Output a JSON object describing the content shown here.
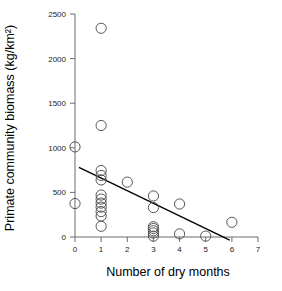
{
  "chart_data": {
    "type": "scatter",
    "title": "",
    "xlabel": "Number of dry months",
    "ylabel": "Primate community biomass (kg/km²)",
    "xlim": [
      0,
      7
    ],
    "ylim": [
      0,
      2500
    ],
    "xticks": [
      0,
      1,
      2,
      3,
      4,
      5,
      6,
      7
    ],
    "xtick_labels": [
      "0",
      "1",
      "2",
      "3",
      "4",
      "5",
      "6",
      "7"
    ],
    "yticks": [
      0,
      500,
      1000,
      1500,
      2000,
      2500
    ],
    "ytick_labels": [
      "0",
      "500",
      "1000",
      "1500",
      "2000",
      "2500"
    ],
    "grid": false,
    "legend": null,
    "marker_style": "open-circle",
    "marker_color": "#555555",
    "points": [
      {
        "x": 0,
        "y": 1010
      },
      {
        "x": 0,
        "y": 375
      },
      {
        "x": 1,
        "y": 2340
      },
      {
        "x": 1,
        "y": 1250
      },
      {
        "x": 1,
        "y": 745
      },
      {
        "x": 1,
        "y": 690
      },
      {
        "x": 1,
        "y": 640
      },
      {
        "x": 1,
        "y": 470
      },
      {
        "x": 1,
        "y": 425
      },
      {
        "x": 1,
        "y": 380
      },
      {
        "x": 1,
        "y": 335
      },
      {
        "x": 1,
        "y": 285
      },
      {
        "x": 1,
        "y": 235
      },
      {
        "x": 1,
        "y": 120
      },
      {
        "x": 2,
        "y": 615
      },
      {
        "x": 3,
        "y": 460
      },
      {
        "x": 3,
        "y": 330
      },
      {
        "x": 3,
        "y": 115
      },
      {
        "x": 3,
        "y": 95
      },
      {
        "x": 3,
        "y": 70
      },
      {
        "x": 3,
        "y": 45
      },
      {
        "x": 3,
        "y": 10
      },
      {
        "x": 4,
        "y": 370
      },
      {
        "x": 4,
        "y": 35
      },
      {
        "x": 5,
        "y": 10
      },
      {
        "x": 6,
        "y": 165
      }
    ],
    "fit_line": {
      "type": "linear-regression",
      "color": "#000000",
      "x_start": 0.15,
      "y_start": 780,
      "x_end": 5.92,
      "y_end": -35
    }
  }
}
